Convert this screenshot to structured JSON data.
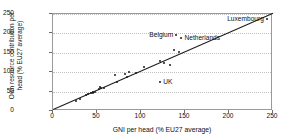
{
  "chart_data": {
    "type": "scatter",
    "title": "",
    "xlabel": "GNI per head (% EU27 average)",
    "ylabel_line1": "Own resource contribution per",
    "ylabel_line2": "head (% EU27 average)",
    "xlim": [
      0,
      250
    ],
    "ylim": [
      0,
      250
    ],
    "xticks": [
      0,
      50,
      100,
      150,
      200,
      250
    ],
    "yticks": [
      0,
      50,
      100,
      150,
      200,
      250
    ],
    "grid": "horizontal-dotted",
    "legend": "none",
    "marker_color": "#1b1b1b",
    "line_color": "#1b1b1b",
    "frame_color": "#9a9a9a",
    "gridline_color": "#c0c0c0",
    "trendline": {
      "x0": 0,
      "y0": 4,
      "x1": 250,
      "y1": 252
    },
    "points": [
      {
        "x": 26,
        "y": 27,
        "label": ""
      },
      {
        "x": 31,
        "y": 31,
        "label": ""
      },
      {
        "x": 38,
        "y": 40,
        "label": ""
      },
      {
        "x": 40,
        "y": 43,
        "label": ""
      },
      {
        "x": 43,
        "y": 46,
        "label": ""
      },
      {
        "x": 45,
        "y": 47,
        "label": ""
      },
      {
        "x": 46,
        "y": 50,
        "label": ""
      },
      {
        "x": 48,
        "y": 49,
        "label": ""
      },
      {
        "x": 52,
        "y": 57,
        "label": ""
      },
      {
        "x": 53,
        "y": 62,
        "label": ""
      },
      {
        "x": 55,
        "y": 60,
        "label": ""
      },
      {
        "x": 58,
        "y": 59,
        "label": ""
      },
      {
        "x": 71,
        "y": 92,
        "label": ""
      },
      {
        "x": 73,
        "y": 75,
        "label": ""
      },
      {
        "x": 82,
        "y": 95,
        "label": ""
      },
      {
        "x": 84,
        "y": 88,
        "label": ""
      },
      {
        "x": 86,
        "y": 100,
        "label": ""
      },
      {
        "x": 94,
        "y": 99,
        "label": ""
      },
      {
        "x": 103,
        "y": 113,
        "label": ""
      },
      {
        "x": 122,
        "y": 128,
        "label": ""
      },
      {
        "x": 126,
        "y": 124,
        "label": ""
      },
      {
        "x": 133,
        "y": 118,
        "label": ""
      },
      {
        "x": 138,
        "y": 158,
        "label": ""
      },
      {
        "x": 140,
        "y": 196,
        "label": "Belgium",
        "label_side": "left"
      },
      {
        "x": 143,
        "y": 152,
        "label": ""
      },
      {
        "x": 146,
        "y": 189,
        "label": "Netherlands",
        "label_side": "right"
      },
      {
        "x": 122,
        "y": 74,
        "label": "UK",
        "label_side": "right"
      },
      {
        "x": 243,
        "y": 238,
        "label": "Luxembourg",
        "label_side": "left"
      }
    ]
  }
}
